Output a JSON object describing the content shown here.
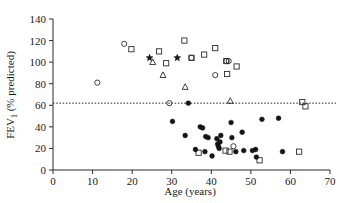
{
  "chart_data": {
    "type": "scatter",
    "title": "",
    "xlabel": "Age (years)",
    "ylabel": "FEV1 (% predicted)",
    "ylabel_main": "FEV",
    "ylabel_sub": "1",
    "ylabel_rest": " (% predicted)",
    "xlim": [
      0,
      70
    ],
    "ylim": [
      0,
      140
    ],
    "xticks": [
      0,
      10,
      20,
      30,
      40,
      50,
      60,
      70
    ],
    "yticks": [
      0,
      20,
      40,
      60,
      80,
      100,
      120,
      140
    ],
    "grid": false,
    "legend": "none",
    "annotations": [
      {
        "name": "reference-line",
        "type": "hline",
        "y": 62,
        "style": "dotted",
        "label": ""
      }
    ],
    "series": [
      {
        "name": "open-circle",
        "marker": "open-circle",
        "points": [
          [
            11.2,
            81
          ],
          [
            18.0,
            117
          ],
          [
            29.4,
            62
          ],
          [
            35.0,
            104
          ],
          [
            41.0,
            88
          ],
          [
            43.8,
            101
          ],
          [
            44.4,
            101
          ],
          [
            45.6,
            22
          ]
        ]
      },
      {
        "name": "open-square",
        "marker": "open-square",
        "points": [
          [
            19.8,
            112
          ],
          [
            26.8,
            110
          ],
          [
            28.6,
            99
          ],
          [
            33.2,
            120
          ],
          [
            35.0,
            104
          ],
          [
            38.2,
            107
          ],
          [
            43.8,
            101
          ],
          [
            41.0,
            113
          ],
          [
            46.4,
            96
          ],
          [
            44.0,
            89
          ],
          [
            36.8,
            16
          ],
          [
            43.6,
            18
          ],
          [
            44.6,
            17
          ],
          [
            52.2,
            9
          ],
          [
            63.0,
            63
          ],
          [
            63.8,
            59
          ],
          [
            62.2,
            17
          ]
        ]
      },
      {
        "name": "filled-star",
        "marker": "filled-star",
        "points": [
          [
            24.4,
            104
          ],
          [
            31.4,
            104
          ]
        ]
      },
      {
        "name": "open-triangle",
        "marker": "open-triangle",
        "points": [
          [
            25.2,
            100
          ],
          [
            27.8,
            88
          ],
          [
            33.4,
            77
          ],
          [
            44.8,
            64
          ]
        ]
      },
      {
        "name": "filled-circle",
        "marker": "filled-circle",
        "points": [
          [
            30.2,
            45
          ],
          [
            33.4,
            32
          ],
          [
            34.2,
            62
          ],
          [
            36.0,
            19
          ],
          [
            37.2,
            40
          ],
          [
            37.8,
            39
          ],
          [
            38.4,
            17
          ],
          [
            38.6,
            31
          ],
          [
            39.2,
            30
          ],
          [
            40.2,
            13
          ],
          [
            41.4,
            29
          ],
          [
            41.6,
            24
          ],
          [
            41.8,
            22
          ],
          [
            42.0,
            20
          ],
          [
            42.2,
            26
          ],
          [
            42.4,
            32
          ],
          [
            45.0,
            44
          ],
          [
            45.2,
            30
          ],
          [
            46.2,
            17
          ],
          [
            47.8,
            35
          ],
          [
            48.2,
            18
          ],
          [
            50.4,
            18
          ],
          [
            51.2,
            19
          ],
          [
            51.4,
            12
          ],
          [
            52.8,
            47
          ],
          [
            57.0,
            48
          ],
          [
            58.0,
            17
          ]
        ]
      }
    ]
  }
}
